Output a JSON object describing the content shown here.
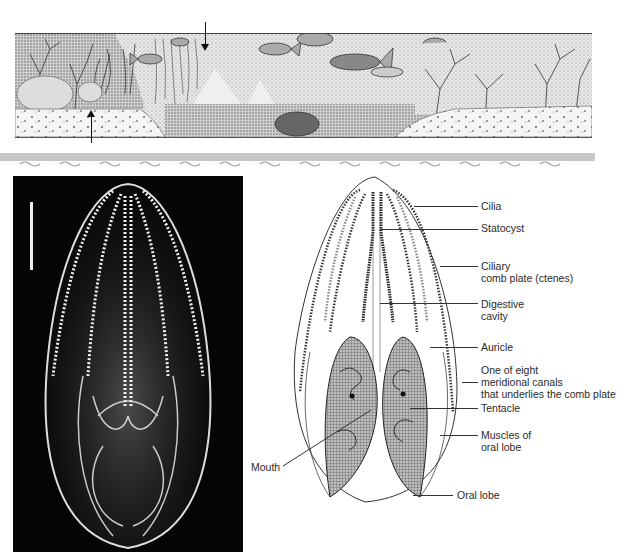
{
  "scene": {
    "description": "Marine habitat cross-section illustration with corals, fish, and sandy seafloor",
    "arrows": [
      {
        "id": "arrow-down",
        "direction": "down",
        "x": 205,
        "y_from": 22,
        "y_to": 48
      },
      {
        "id": "arrow-up",
        "direction": "up",
        "x": 91,
        "y_from": 142,
        "y_to": 110
      }
    ]
  },
  "divider_band": {
    "color": "#c8c8c8"
  },
  "photo": {
    "description": "Photograph of a comb jelly (ctenophore) on black background",
    "scale_bar": {
      "x": 30,
      "y_top": 202,
      "y_bottom": 270
    }
  },
  "diagram": {
    "labels": [
      {
        "text": "Cilia",
        "x": 481,
        "y": 200,
        "leader_from": 414,
        "leader_y": 206
      },
      {
        "text": "Statocyst",
        "x": 481,
        "y": 222,
        "leader_from": 380,
        "leader_y": 229
      },
      {
        "text": "Ciliary",
        "x": 481,
        "y": 260,
        "leader_from": 440,
        "leader_y": 266
      },
      {
        "text": "comb plate (ctenes)",
        "x": 481,
        "y": 272
      },
      {
        "text": "Digestive",
        "x": 481,
        "y": 298,
        "leader_from": 380,
        "leader_y": 303
      },
      {
        "text": "cavity",
        "x": 481,
        "y": 310
      },
      {
        "text": "Auricle",
        "x": 481,
        "y": 341,
        "leader_from": 430,
        "leader_y": 347
      },
      {
        "text": "One of eight",
        "x": 481,
        "y": 364,
        "leader_from": 462,
        "leader_y": 382
      },
      {
        "text": "meridional canals",
        "x": 481,
        "y": 376
      },
      {
        "text": "that underlies the comb plate",
        "x": 481,
        "y": 388
      },
      {
        "text": "Tentacle",
        "x": 481,
        "y": 402,
        "leader_from": 410,
        "leader_y": 408
      },
      {
        "text": "Muscles of",
        "x": 481,
        "y": 429,
        "leader_from": 440,
        "leader_y": 435
      },
      {
        "text": "oral lobe",
        "x": 481,
        "y": 441
      },
      {
        "text": "Oral lobe",
        "x": 457,
        "y": 489,
        "leader_from": 413,
        "leader_y": 495
      },
      {
        "text": "Mouth",
        "x": 251,
        "y": 461
      }
    ]
  }
}
